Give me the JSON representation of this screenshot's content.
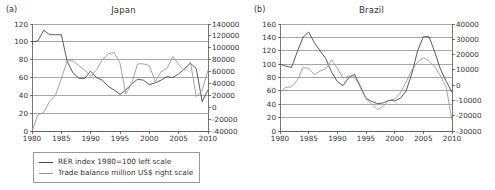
{
  "figure": {
    "colors": {
      "rer_line": "#4a4a4a",
      "trade_line": "#9b9b9b",
      "grid": "#6e6e6e",
      "axis": "#555555",
      "text": "#333333"
    },
    "legend": {
      "rer_label": "RER index 1980=100 left scale",
      "trade_label": "Trade balance million US$ right scale"
    }
  },
  "panels": [
    {
      "tag": "(a)",
      "title": "Japan"
    },
    {
      "tag": "(b)",
      "title": "Brazil"
    }
  ],
  "chart_data": [
    {
      "type": "line",
      "title": "Japan",
      "panel": "(a)",
      "xlabel": "",
      "ylabel": "",
      "xlim": [
        1980,
        2010
      ],
      "xticks": [
        1980,
        1985,
        1990,
        1995,
        2000,
        2005,
        2010
      ],
      "xtick_labels": [
        "1980",
        "1985",
        "1990",
        "1995",
        "2000",
        "2005",
        "2010"
      ],
      "y_left": {
        "label": "RER index 1980=100 left scale",
        "lim": [
          0,
          120
        ],
        "ticks": [
          0,
          20,
          40,
          60,
          80,
          100,
          120
        ],
        "tick_labels": [
          "0",
          "20",
          "40",
          "60",
          "80",
          "100",
          "120"
        ]
      },
      "y_right": {
        "label": "Trade balance million US$ right scale",
        "lim": [
          -40000,
          140000
        ],
        "ticks": [
          -40000,
          -20000,
          0,
          20000,
          40000,
          60000,
          80000,
          100000,
          120000,
          140000
        ],
        "tick_labels": [
          "-40000",
          "-20000",
          "0",
          "20000",
          "40000",
          "60000",
          "80000",
          "100000",
          "120000",
          "140000"
        ]
      },
      "grid": true,
      "legend_position": "below",
      "x": [
        1980,
        1981,
        1982,
        1983,
        1984,
        1985,
        1986,
        1987,
        1988,
        1989,
        1990,
        1991,
        1992,
        1993,
        1994,
        1995,
        1996,
        1997,
        1998,
        1999,
        2000,
        2001,
        2002,
        2003,
        2004,
        2005,
        2006,
        2007,
        2008,
        2009,
        2010
      ],
      "series": [
        {
          "name": "RER index 1980=100 left scale",
          "axis": "left",
          "color": "#4a4a4a",
          "values": [
            100,
            101,
            113,
            108,
            108,
            108,
            78,
            65,
            59,
            59,
            67,
            60,
            57,
            50,
            46,
            41,
            46,
            53,
            58,
            57,
            52,
            54,
            57,
            61,
            60,
            64,
            70,
            76,
            70,
            33,
            46
          ]
        },
        {
          "name": "Trade balance million US$ right scale",
          "axis": "right",
          "color": "#9b9b9b",
          "values": [
            -40000,
            -13000,
            -9000,
            10000,
            20000,
            48000,
            78000,
            78000,
            70000,
            62000,
            52000,
            63000,
            80000,
            90000,
            92000,
            74000,
            22000,
            40000,
            73000,
            73000,
            70000,
            43000,
            60000,
            65000,
            85000,
            72000,
            62000,
            76000,
            18000,
            28000,
            62000
          ]
        }
      ]
    },
    {
      "type": "line",
      "title": "Brazil",
      "panel": "(b)",
      "xlabel": "",
      "ylabel": "",
      "xlim": [
        1980,
        2010
      ],
      "xticks": [
        1980,
        1985,
        1990,
        1995,
        2000,
        2005,
        2010
      ],
      "xtick_labels": [
        "1980",
        "1985",
        "1990",
        "1995",
        "2000",
        "2005",
        "2010"
      ],
      "y_left": {
        "label": "RER index 1980=100 left scale",
        "lim": [
          0,
          160
        ],
        "ticks": [
          0,
          20,
          40,
          60,
          80,
          100,
          120,
          140,
          160
        ],
        "tick_labels": [
          "0",
          "20",
          "40",
          "60",
          "80",
          "100",
          "120",
          "140",
          "160"
        ]
      },
      "y_right": {
        "label": "Trade balance million US$ right scale",
        "lim": [
          -30000,
          40000
        ],
        "ticks": [
          -30000,
          -20000,
          -10000,
          0,
          10000,
          20000,
          30000,
          40000
        ],
        "tick_labels": [
          "-30000",
          "-20000",
          "-10000",
          "0",
          "10000",
          "20000",
          "30000",
          "40000"
        ]
      },
      "grid": true,
      "legend_position": "below",
      "x": [
        1980,
        1981,
        1982,
        1983,
        1984,
        1985,
        1986,
        1987,
        1988,
        1989,
        1990,
        1991,
        1992,
        1993,
        1994,
        1995,
        1996,
        1997,
        1998,
        1999,
        2000,
        2001,
        2002,
        2003,
        2004,
        2005,
        2006,
        2007,
        2008,
        2009,
        2010
      ],
      "series": [
        {
          "name": "RER index 1980=100 left scale",
          "axis": "left",
          "color": "#4a4a4a",
          "values": [
            100,
            97,
            95,
            118,
            140,
            148,
            132,
            120,
            108,
            88,
            74,
            68,
            80,
            85,
            67,
            49,
            44,
            41,
            42,
            46,
            45,
            49,
            60,
            86,
            120,
            141,
            141,
            118,
            92,
            74,
            58
          ]
        },
        {
          "name": "Trade balance million US$ right scale",
          "axis": "right",
          "color": "#9b9b9b",
          "values": [
            -4800,
            -1400,
            -1200,
            3000,
            11500,
            11000,
            7000,
            9200,
            10800,
            16500,
            11000,
            4500,
            6000,
            5800,
            -1500,
            -9000,
            -12500,
            -16000,
            -14000,
            -10000,
            -9000,
            -5000,
            2000,
            10000,
            15000,
            18000,
            16000,
            12000,
            6000,
            -1500,
            -23000
          ]
        }
      ]
    }
  ]
}
